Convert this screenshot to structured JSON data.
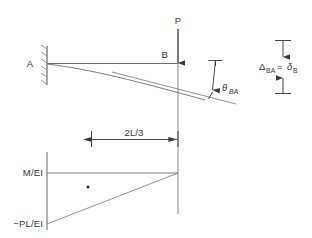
{
  "figure": {
    "type": "structural-engineering-diagram",
    "colors": {
      "line": "#5a5a5a",
      "text": "#333333",
      "background": "#ffffff",
      "dot": "#2b2b2b"
    },
    "beam_diagram": {
      "support_label": "A",
      "point_label": "B",
      "load_label": "P",
      "angle_label": "θ",
      "angle_subscript": "BA",
      "deflection_label": "Δ",
      "deflection_subscript_1": "BA",
      "deflection_equals": "=",
      "deflection_label_2": "δ",
      "deflection_subscript_2": "B"
    },
    "dimension": {
      "length_label": "2L/3"
    },
    "moment_diagram": {
      "top_label": "M/EI",
      "bottom_label": "−PL/EI"
    }
  }
}
